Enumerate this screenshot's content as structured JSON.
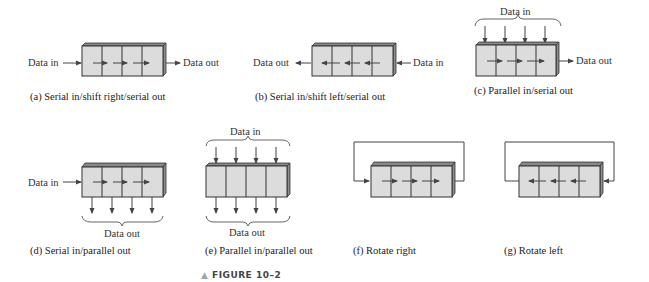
{
  "figure": {
    "label": "FIGURE 10–2",
    "marker": "▲"
  },
  "panels": [
    {
      "id": "a",
      "caption": "(a) Serial in/shift right/serial out",
      "inputs": [
        "Data in"
      ],
      "outputs": [
        "Data out"
      ],
      "shift_direction": "right"
    },
    {
      "id": "b",
      "caption": "(b) Serial in/shift left/serial out",
      "inputs": [
        "Data in"
      ],
      "outputs": [
        "Data out"
      ],
      "shift_direction": "left"
    },
    {
      "id": "c",
      "caption": "(c) Parallel in/serial out",
      "inputs": [
        "Data in"
      ],
      "outputs": [
        "Data out"
      ],
      "shift_direction": "right"
    },
    {
      "id": "d",
      "caption": "(d) Serial in/parallel out",
      "inputs": [
        "Data in"
      ],
      "outputs": [
        "Data out"
      ],
      "shift_direction": "right"
    },
    {
      "id": "e",
      "caption": "(e) Parallel in/parallel out",
      "inputs": [
        "Data in"
      ],
      "outputs": [
        "Data out"
      ],
      "shift_direction": "none"
    },
    {
      "id": "f",
      "caption": "(f) Rotate right",
      "inputs": [],
      "outputs": [],
      "shift_direction": "right"
    },
    {
      "id": "g",
      "caption": "(g) Rotate left",
      "inputs": [],
      "outputs": [],
      "shift_direction": "left"
    }
  ],
  "labels": {
    "data_in": "Data in",
    "data_out": "Data out"
  }
}
